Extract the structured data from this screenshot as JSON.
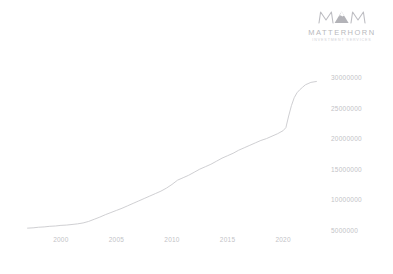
{
  "brand": {
    "mark_icon": "mountain-monogram-icon",
    "name": "MATTERHORN",
    "tagline": "INVESTMENT SERVICES"
  },
  "chart_data": {
    "type": "line",
    "title": "",
    "subtitle": "",
    "xlabel": "",
    "ylabel": "",
    "grid": false,
    "legend": false,
    "y_axis_side": "right",
    "xlim": [
      1996.5,
      2023.5
    ],
    "ylim": [
      4000000,
      31000000
    ],
    "xticks": [
      2000,
      2005,
      2010,
      2015,
      2020
    ],
    "xtick_labels": [
      "2000",
      "2005",
      "2010",
      "2015",
      "2020"
    ],
    "yticks": [
      5000000,
      10000000,
      15000000,
      20000000,
      25000000,
      30000000
    ],
    "ytick_labels": [
      "5000000",
      "10000000",
      "15000000",
      "20000000",
      "25000000",
      "30000000"
    ],
    "line_color": "#c9c9cd",
    "series": [
      {
        "name": "value",
        "x": [
          1997.0,
          1997.5,
          1998.0,
          1998.5,
          1999.0,
          1999.5,
          2000.0,
          2000.5,
          2001.0,
          2001.5,
          2002.0,
          2002.5,
          2003.0,
          2003.5,
          2004.0,
          2004.5,
          2005.0,
          2005.5,
          2006.0,
          2006.5,
          2007.0,
          2007.5,
          2008.0,
          2008.5,
          2009.0,
          2009.5,
          2010.0,
          2010.5,
          2011.0,
          2011.5,
          2012.0,
          2012.5,
          2013.0,
          2013.5,
          2014.0,
          2014.5,
          2015.0,
          2015.5,
          2016.0,
          2016.5,
          2017.0,
          2017.5,
          2018.0,
          2018.5,
          2019.0,
          2019.5,
          2020.0,
          2020.25,
          2020.5,
          2020.75,
          2021.0,
          2021.25,
          2021.5,
          2021.75,
          2022.0,
          2022.5,
          2023.0
        ],
        "values": [
          5450000,
          5500000,
          5600000,
          5650000,
          5750000,
          5800000,
          5900000,
          5950000,
          6050000,
          6150000,
          6300000,
          6550000,
          6900000,
          7250000,
          7650000,
          8000000,
          8350000,
          8700000,
          9100000,
          9500000,
          9900000,
          10300000,
          10700000,
          11100000,
          11500000,
          12000000,
          12600000,
          13300000,
          13700000,
          14100000,
          14600000,
          15100000,
          15500000,
          15900000,
          16400000,
          16900000,
          17300000,
          17700000,
          18200000,
          18600000,
          19000000,
          19400000,
          19800000,
          20100000,
          20500000,
          20900000,
          21400000,
          21900000,
          23800000,
          25500000,
          26800000,
          27600000,
          28100000,
          28500000,
          28900000,
          29300000,
          29450000
        ]
      }
    ]
  }
}
